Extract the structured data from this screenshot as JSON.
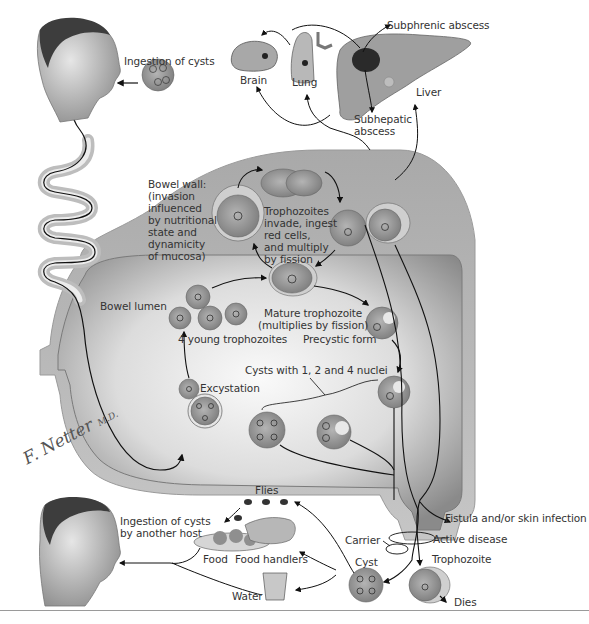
{
  "signature": {
    "text": "F. Netter",
    "suffix": "M.D."
  },
  "labels": {
    "ingestion_of_cysts": "Ingestion of cysts",
    "brain": "Brain",
    "lung": "Lung",
    "liver": "Liver",
    "subphrenic_abscess": "Subphrenic abscess",
    "subhepatic_abscess": "Subhepatic\nabscess",
    "bowel_wall": "Bowel wall:\n(invasion\ninfluenced\nby nutritional\nstate and\ndynamicity\nof mucosa)",
    "trophozoites_invade": "Trophozoites\ninvade, ingest\nred cells,\nand multiply\nby fission",
    "bowel_lumen": "Bowel lumen",
    "mature_trophozoite": "Mature trophozoite\n(multiplies by fission)",
    "four_young_trophozoites": "4 young trophozoites",
    "precystic_form": "Precystic form",
    "cysts_with_nuclei": "Cysts with 1, 2 and 4 nuclei",
    "excystation": "Excystation",
    "flies": "Flies",
    "ingestion_another_host": "Ingestion of cysts\nby another host",
    "food": "Food",
    "food_handlers": "Food handlers",
    "water": "Water",
    "carrier": "Carrier",
    "active_disease": "Active disease",
    "cyst": "Cyst",
    "trophozoite": "Trophozoite",
    "dies": "Dies",
    "fistula": "Fistula and/or skin infection"
  },
  "colors": {
    "background": "#ffffff",
    "bowel_wall": "#bdbdbd",
    "bowel_lumen_dark": "#8e8e8e",
    "bowel_lumen_light": "#f2f2f2",
    "cell_fill": "#9c9c9c",
    "cell_halo": "#cfcfcf",
    "arrow": "#111111",
    "text": "#333333"
  }
}
